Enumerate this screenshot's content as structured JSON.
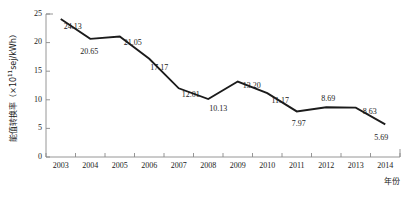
{
  "chart_data": {
    "type": "line",
    "title": "",
    "subtitle": "",
    "xlabel": "年份",
    "ylabel_main": "能值转换率",
    "ylabel_unit_open": "（×10",
    "ylabel_unit_exp": "11",
    "ylabel_unit_close": "sej/kWh）",
    "ylabel_full": "能值转换率（×10¹¹sej/kWh）",
    "categories": [
      "2003",
      "2004",
      "2005",
      "2006",
      "2007",
      "2008",
      "2009",
      "2010",
      "2011",
      "2012",
      "2013",
      "2014"
    ],
    "x": [
      2003,
      2004,
      2005,
      2006,
      2007,
      2008,
      2009,
      2010,
      2011,
      2012,
      2013,
      2014
    ],
    "values": [
      24.13,
      20.65,
      21.05,
      17.17,
      12.01,
      10.13,
      13.2,
      11.17,
      7.97,
      8.69,
      8.63,
      5.69
    ],
    "point_labels": [
      "24.13",
      "20.65",
      "21.05",
      "17.17",
      "12.01",
      "10.13",
      "13.20",
      "11.17",
      "7.97",
      "8.69",
      "8.63",
      "5.69"
    ],
    "ylim": [
      0,
      25
    ],
    "yticks": [
      0,
      5,
      10,
      15,
      20,
      25
    ],
    "ytick_labels": [
      "0",
      "5",
      "10",
      "15",
      "20",
      "25"
    ],
    "grid": false,
    "legend": "none",
    "series": [
      {
        "name": "能值转换率",
        "values": [
          24.13,
          20.65,
          21.05,
          17.17,
          12.01,
          10.13,
          13.2,
          11.17,
          7.97,
          8.69,
          8.63,
          5.69
        ],
        "color": "#1b1b1b"
      }
    ],
    "colors": {
      "line": "#1b1b1b",
      "axis": "#8a8a8a",
      "text": "#1a1a1a",
      "background": "#ffffff"
    }
  }
}
